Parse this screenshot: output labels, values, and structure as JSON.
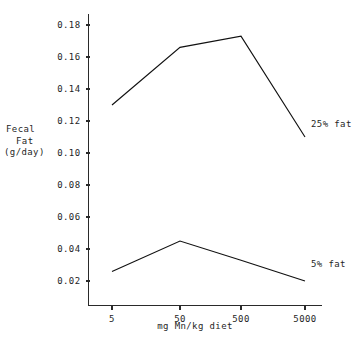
{
  "chart_data": {
    "type": "line",
    "title": "",
    "subtitle": "",
    "xlabel": "mg Mn/kg diet",
    "ylabel": "Fecal Fat (g/day)",
    "ylabel_lines": [
      "Fecal",
      "Fat",
      "(g/day)"
    ],
    "categories": [
      "5",
      "50",
      "500",
      "5000"
    ],
    "x_tick_labels": [
      "5",
      "50",
      "500",
      "5000"
    ],
    "y_tick_labels": [
      "0.02",
      "0.04",
      "0.06",
      "0.08",
      "0.10",
      "0.12",
      "0.14",
      "0.16",
      "0.18"
    ],
    "y_tick_values": [
      0.02,
      0.04,
      0.06,
      0.08,
      0.1,
      0.12,
      0.14,
      0.16,
      0.18
    ],
    "ylim": [
      0.0,
      0.19
    ],
    "grid": false,
    "legend_position": "right-of-line-ends",
    "series": [
      {
        "name": "25% fat",
        "values": [
          0.13,
          0.166,
          0.173,
          0.11
        ]
      },
      {
        "name": "5% fat",
        "values": [
          0.026,
          0.045,
          0.033,
          0.02
        ]
      }
    ]
  },
  "annotations": {
    "series_labels": [
      "25% fat",
      "5% fat"
    ]
  }
}
